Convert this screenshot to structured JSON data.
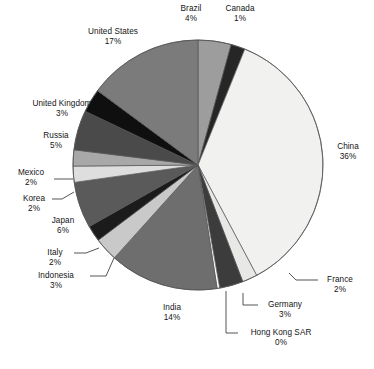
{
  "chart_data": {
    "type": "pie",
    "title": "",
    "subtitle": "",
    "xlabel": "",
    "ylabel": "",
    "legend_position": "none",
    "grid": false,
    "start_angle_deg": 0,
    "direction": "clockwise",
    "center": {
      "x": 198,
      "y": 165
    },
    "radius": 125,
    "labels_show_percent": true,
    "categories": [
      "Brazil",
      "Canada",
      "China",
      "France",
      "Germany",
      "Hong Kong SAR",
      "India",
      "Indonesia",
      "Italy",
      "Japan",
      "Korea",
      "Mexico",
      "Russia",
      "United Kingdom",
      "United States"
    ],
    "values": [
      4,
      1,
      36,
      2,
      3,
      0,
      14,
      3,
      2,
      6,
      2,
      2,
      5,
      3,
      17
    ],
    "percent_labels": [
      "4%",
      "1%",
      "36%",
      "2%",
      "3%",
      "0%",
      "14%",
      "3%",
      "2%",
      "6%",
      "2%",
      "2%",
      "5%",
      "3%",
      "17%"
    ],
    "slice_colors": [
      "#9d9d9d",
      "#262626",
      "#f1f1ef",
      "#e8e8e6",
      "#3c3c3c",
      "#ffffff",
      "#6e6e6e",
      "#c9c9c9",
      "#1b1b1b",
      "#5a5a5a",
      "#dedede",
      "#a8a8a8",
      "#4a4a4a",
      "#0f0f0f",
      "#7b7b7b"
    ],
    "slice_angles_deg": [
      {
        "name": "Brazil",
        "start": 0,
        "end": 15.4
      },
      {
        "name": "Canada",
        "start": 15.4,
        "end": 22.0
      },
      {
        "name": "China",
        "start": 22.0,
        "end": 152.0
      },
      {
        "name": "France",
        "start": 152.0,
        "end": 159.0
      },
      {
        "name": "Germany",
        "start": 159.0,
        "end": 170.0
      },
      {
        "name": "Hong Kong SAR",
        "start": 170.0,
        "end": 171.2
      },
      {
        "name": "India",
        "start": 171.2,
        "end": 222.0
      },
      {
        "name": "Indonesia",
        "start": 222.0,
        "end": 233.0
      },
      {
        "name": "Italy",
        "start": 233.0,
        "end": 240.5
      },
      {
        "name": "Japan",
        "start": 240.5,
        "end": 262.0
      },
      {
        "name": "Korea",
        "start": 262.0,
        "end": 269.5
      },
      {
        "name": "Mexico",
        "start": 269.5,
        "end": 277.0
      },
      {
        "name": "Russia",
        "start": 277.0,
        "end": 295.5
      },
      {
        "name": "United Kingdom",
        "start": 295.5,
        "end": 306.5
      },
      {
        "name": "United States",
        "start": 306.5,
        "end": 360.0
      }
    ],
    "stroke_color": "#555555",
    "background": "#ffffff"
  },
  "labels": {
    "brazil": {
      "name": "Brazil",
      "pct": "4%"
    },
    "canada": {
      "name": "Canada",
      "pct": "1%"
    },
    "china": {
      "name": "China",
      "pct": "36%"
    },
    "france": {
      "name": "France",
      "pct": "2%"
    },
    "germany": {
      "name": "Germany",
      "pct": "3%"
    },
    "hongkong": {
      "name": "Hong Kong SAR",
      "pct": "0%"
    },
    "india": {
      "name": "India",
      "pct": "14%"
    },
    "indonesia": {
      "name": "Indonesia",
      "pct": "3%"
    },
    "italy": {
      "name": "Italy",
      "pct": "2%"
    },
    "japan": {
      "name": "Japan",
      "pct": "6%"
    },
    "korea": {
      "name": "Korea",
      "pct": "2%"
    },
    "mexico": {
      "name": "Mexico",
      "pct": "2%"
    },
    "russia": {
      "name": "Russia",
      "pct": "5%"
    },
    "uk": {
      "name": "United Kingdom",
      "pct": "3%"
    },
    "us": {
      "name": "United States",
      "pct": "17%"
    }
  },
  "caption": {
    "text": ""
  }
}
